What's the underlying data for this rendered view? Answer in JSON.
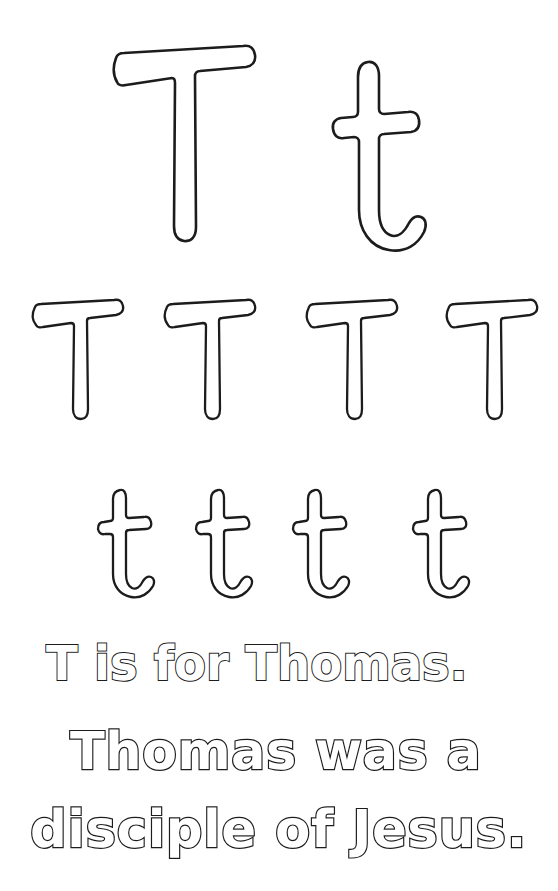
{
  "worksheet": {
    "letter_upper": "T",
    "letter_lower": "t",
    "ink_color": "#1c1c1c",
    "page_background": "#ffffff",
    "hero_row": {
      "glyphs": [
        {
          "name": "uppercase-T",
          "char": "T"
        },
        {
          "name": "lowercase-t",
          "char": "t"
        }
      ]
    },
    "practice_row_upper": {
      "glyphs": [
        {
          "char": "T"
        },
        {
          "char": "T"
        },
        {
          "char": "T"
        },
        {
          "char": "T"
        }
      ]
    },
    "practice_row_lower": {
      "glyphs": [
        {
          "char": "t"
        },
        {
          "char": "t"
        },
        {
          "char": "t"
        },
        {
          "char": "t"
        }
      ]
    },
    "sentences": [
      {
        "text": "T is for Thomas."
      },
      {
        "text": "Thomas was a"
      },
      {
        "text": "disciple of Jesus."
      }
    ]
  }
}
